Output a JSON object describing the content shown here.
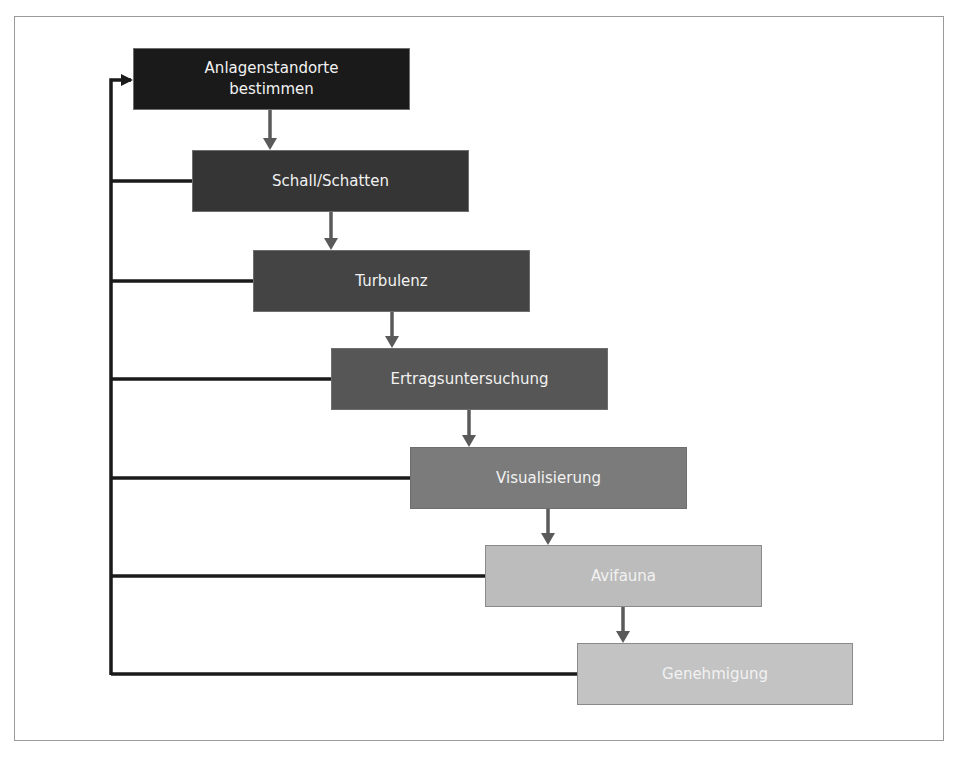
{
  "diagram": {
    "type": "flowchart",
    "steps": [
      {
        "label": "Anlagenstandorte bestimmen",
        "line1": "Anlagenstandorte",
        "line2": "bestimmen",
        "color": "#1a1a1a"
      },
      {
        "label": "Schall/Schatten",
        "color": "#353535"
      },
      {
        "label": "Turbulenz",
        "color": "#444444"
      },
      {
        "label": "Ertragsuntersuchung",
        "color": "#565656"
      },
      {
        "label": "Visualisierung",
        "color": "#7b7b7b"
      },
      {
        "label": "Avifauna",
        "color": "#bcbcbc"
      },
      {
        "label": "Genehmigung",
        "color": "#c3c3c3"
      }
    ],
    "feedback_loop": "all steps return to Anlagenstandorte bestimmen",
    "colors": {
      "arrow": "#5a5a5a",
      "feedback_line": "#1a1a1a",
      "frame": "#9a9a9a"
    }
  }
}
